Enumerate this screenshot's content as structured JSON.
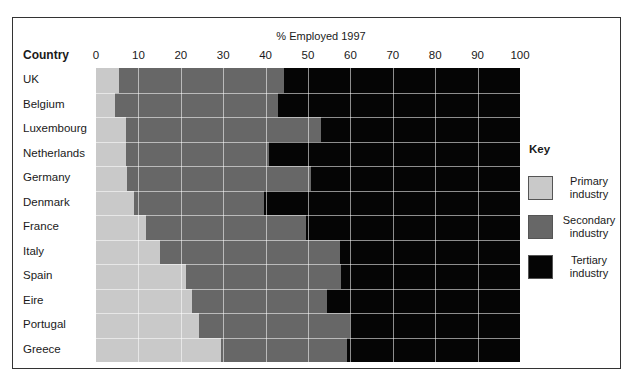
{
  "chart_data": {
    "type": "bar",
    "orientation": "horizontal",
    "stacked": true,
    "title": "% Employed 1997",
    "ylabel": "Country",
    "xlabel": "% Employed 1997",
    "xlim": [
      0,
      100
    ],
    "xticks": [
      0,
      10,
      20,
      30,
      40,
      50,
      60,
      70,
      80,
      90,
      100
    ],
    "grid": true,
    "legend": {
      "title": "Key",
      "position": "right"
    },
    "categories": [
      "UK",
      "Belgium",
      "Luxembourg",
      "Netherlands",
      "Germany",
      "Denmark",
      "France",
      "Italy",
      "Spain",
      "Eire",
      "Portugal",
      "Greece"
    ],
    "series": [
      {
        "name": "Primary industry",
        "color": "#c9c9c9",
        "values": [
          5.5,
          4.4,
          7.1,
          7.0,
          7.3,
          8.9,
          11.7,
          15.2,
          21.3,
          22.6,
          24.3,
          29.4
        ]
      },
      {
        "name": "Secondary industry",
        "color": "#676767",
        "values": [
          38.8,
          38.6,
          45.9,
          33.7,
          43.5,
          30.7,
          37.9,
          42.3,
          36.6,
          31.8,
          35.7,
          29.9
        ]
      },
      {
        "name": "Tertiary industry",
        "color": "#050505",
        "values": [
          55.7,
          57.0,
          47.0,
          59.3,
          49.2,
          60.4,
          50.4,
          42.5,
          42.1,
          45.6,
          40.0,
          40.7
        ]
      }
    ]
  },
  "chart": {
    "title": "% Employed 1997",
    "column_header": "Country",
    "ticks": [
      "0",
      "10",
      "20",
      "30",
      "40",
      "50",
      "60",
      "70",
      "80",
      "90",
      "100"
    ],
    "countries": [
      "UK",
      "Belgium",
      "Luxembourg",
      "Netherlands",
      "Germany",
      "Denmark",
      "France",
      "Italy",
      "Spain",
      "Eire",
      "Portugal",
      "Greece"
    ]
  },
  "key": {
    "title": "Key",
    "items": [
      {
        "label_line1": "Primary",
        "label_line2": "industry",
        "color": "#c9c9c9"
      },
      {
        "label_line1": "Secondary",
        "label_line2": "industry",
        "color": "#676767"
      },
      {
        "label_line1": "Tertiary",
        "label_line2": "industry",
        "color": "#050505"
      }
    ]
  }
}
